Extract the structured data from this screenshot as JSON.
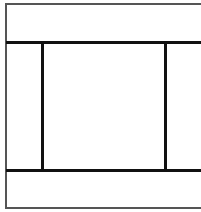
{
  "diagram": {
    "type": "wireframe-layout",
    "regions": [
      {
        "name": "header",
        "label": ""
      },
      {
        "name": "left-sidebar",
        "label": ""
      },
      {
        "name": "main-content",
        "label": ""
      },
      {
        "name": "right-sidebar",
        "label": ""
      },
      {
        "name": "footer",
        "label": ""
      }
    ],
    "colors": {
      "background": "#ffffff",
      "line": "#111111",
      "frame": "#555555"
    }
  }
}
